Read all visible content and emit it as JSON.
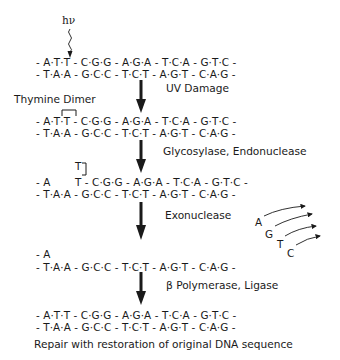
{
  "diagram": {
    "photon_label": "hν",
    "stage1": {
      "top_strand": "- A·T·T - C·G·G - A·G·A - T·C·A - G·T·C -",
      "bottom_strand": "- T·A·A - G·C·C - T·C·T - A·G·T - C·A·G -"
    },
    "step1_label": "UV Damage",
    "dimer_label": "Thymine Dimer",
    "stage2": {
      "top_strand": "- A·T·T - C·G·G - A·G·A - T·C·A - G·T·C -",
      "bottom_strand": "- T·A·A - G·C·C - T·C·T - A·G·T - C·A·G -"
    },
    "step2_label": "Glycosylase, Endonuclease",
    "stage3": {
      "excised_base": "T",
      "top_strand_left": "- A",
      "top_strand_right": "T - C·G·G - A·G·A - T·C·A - G·T·C -",
      "bottom_strand": "- T·A·A - G·C·C - T·C·T - A·G·T - C·A·G -"
    },
    "step3_label": "Exonuclease",
    "released_nucleotides": [
      "A",
      "G",
      "T",
      "C"
    ],
    "stage4": {
      "top_strand": "- A",
      "bottom_strand": "- T·A·A - G·C·C - T·C·T - A·G·T - C·A·G -"
    },
    "step4_label": "β Polymerase, Ligase",
    "stage5": {
      "top_strand": "- A·T·T - C·G·G - A·G·A - T·C·A - G·T·C -",
      "bottom_strand": "- T·A·A - G·C·C - T·C·T - A·G·T - C·A·G -"
    },
    "caption": "Repair with restoration of original DNA sequence",
    "colors": {
      "ink": "#1a1a1a",
      "background": "#ffffff"
    }
  }
}
